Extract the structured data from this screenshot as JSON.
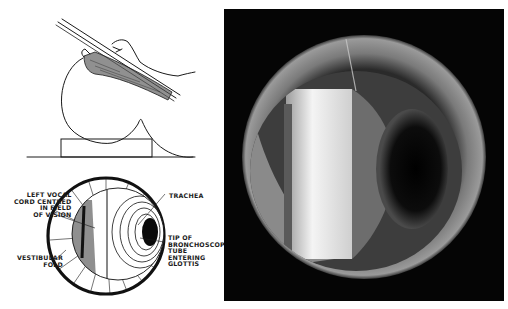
{
  "figure": {
    "panels": [
      {
        "id": "patient-position-sketch",
        "description": "Side view of head with bronchoscope inserted"
      },
      {
        "id": "bronchoscope-view-diagram",
        "description": "Labelled diagram of view through bronchoscope"
      },
      {
        "id": "endoscopic-photograph",
        "description": "Photograph through bronchoscope"
      }
    ],
    "labels": {
      "left_vocal_cord": "LEFT VOCAL\nCORD CENTRED\nIN FIELD\nOF VISION",
      "trachea": "TRACHEA",
      "bronchoscope_tip": "TIP OF\nBRONCHOSCOPE\nTUBE\nENTERING\nGLOTTIS",
      "vestibular_fold": "VESTIBULAR\nFOLD"
    },
    "colors": {
      "ink": "#1a1a1a",
      "background": "#ffffff",
      "photo_frame": "#050505"
    }
  }
}
